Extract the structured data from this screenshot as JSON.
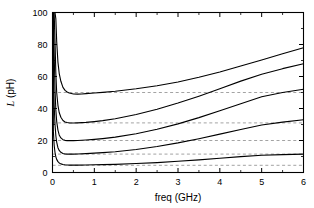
{
  "chart_data": {
    "type": "line",
    "title": "",
    "xlabel": "freq (GHz)",
    "ylabel": "L (pH)",
    "ylabel_symbol": "L",
    "ylabel_unit": "(pH)",
    "xlim": [
      0,
      6
    ],
    "ylim": [
      0,
      100
    ],
    "xticks": [
      0,
      1,
      2,
      3,
      4,
      5,
      6
    ],
    "xticklabels": [
      "0",
      "1",
      "2",
      "3",
      "4",
      "5",
      "6"
    ],
    "yticks": [
      0,
      20,
      40,
      60,
      80,
      100
    ],
    "yticklabels": [
      "0",
      "20",
      "40",
      "60",
      "80",
      "100"
    ],
    "x_minor_step": 0.5,
    "y_minor_step": 10,
    "grid": false,
    "legend": null,
    "line_color": "#000000",
    "asymptote_color": "#999999",
    "asymptote_style": "dashed",
    "asymptotes": [
      50,
      31,
      20,
      11.5,
      4.5
    ],
    "series": [
      {
        "name": "L1",
        "asymptote": 50,
        "end_value": 78,
        "x": [
          0.02,
          0.04,
          0.06,
          0.08,
          0.1,
          0.13,
          0.16,
          0.2,
          0.25,
          0.3,
          0.35,
          0.4,
          0.5,
          0.6,
          0.7,
          0.8,
          1.0,
          1.2,
          1.5,
          2.0,
          2.5,
          3.0,
          3.5,
          4.0,
          4.5,
          5.0,
          5.5,
          6.0
        ],
        "y": [
          100,
          100,
          100,
          96,
          82,
          69,
          62,
          57,
          53.2,
          51.3,
          50.3,
          49.7,
          49.1,
          49.0,
          49.1,
          49.3,
          49.7,
          50.1,
          50.8,
          52.3,
          54.2,
          56.6,
          59.5,
          62.8,
          66.6,
          70.3,
          74.2,
          78.0
        ]
      },
      {
        "name": "L2",
        "asymptote": 31,
        "end_value": 68,
        "x": [
          0.02,
          0.04,
          0.06,
          0.08,
          0.1,
          0.13,
          0.16,
          0.2,
          0.25,
          0.3,
          0.35,
          0.4,
          0.5,
          0.6,
          0.8,
          1.0,
          1.2,
          1.5,
          2.0,
          2.5,
          3.0,
          3.5,
          4.0,
          4.5,
          5.0,
          5.5,
          6.0
        ],
        "y": [
          100,
          100,
          82,
          62,
          50,
          42,
          37.5,
          34.5,
          32.5,
          31.6,
          31.2,
          31.0,
          30.9,
          31.0,
          31.3,
          31.8,
          32.4,
          33.6,
          36.2,
          39.5,
          43.4,
          47.7,
          52.3,
          57.1,
          61.4,
          64.9,
          68.0
        ]
      },
      {
        "name": "L3",
        "asymptote": 20,
        "end_value": 52,
        "x": [
          0.02,
          0.04,
          0.06,
          0.08,
          0.1,
          0.13,
          0.16,
          0.2,
          0.25,
          0.3,
          0.35,
          0.4,
          0.5,
          0.6,
          0.8,
          1.0,
          1.2,
          1.5,
          2.0,
          2.5,
          3.0,
          3.5,
          4.0,
          4.5,
          5.0,
          5.5,
          6.0
        ],
        "y": [
          100,
          74,
          52,
          39,
          32,
          26.5,
          23.5,
          21.6,
          20.5,
          20.1,
          19.9,
          19.9,
          19.9,
          20.0,
          20.3,
          20.7,
          21.2,
          22.1,
          24.2,
          27.0,
          30.4,
          34.3,
          38.6,
          43.0,
          47.3,
          50.0,
          52.0
        ]
      },
      {
        "name": "L4",
        "asymptote": 11.5,
        "end_value": 33,
        "x": [
          0.02,
          0.04,
          0.06,
          0.08,
          0.1,
          0.13,
          0.16,
          0.2,
          0.25,
          0.3,
          0.35,
          0.4,
          0.5,
          0.6,
          0.8,
          1.0,
          1.2,
          1.5,
          2.0,
          2.5,
          3.0,
          3.5,
          4.0,
          4.5,
          5.0,
          5.5,
          6.0
        ],
        "y": [
          66,
          42,
          30,
          23,
          19,
          15.5,
          13.8,
          12.6,
          11.9,
          11.6,
          11.5,
          11.5,
          11.5,
          11.6,
          11.8,
          12.1,
          12.4,
          13.0,
          14.4,
          16.2,
          18.5,
          21.1,
          24.0,
          26.9,
          29.7,
          31.5,
          33.0
        ]
      },
      {
        "name": "L5",
        "asymptote": 4.5,
        "end_value": 11.5,
        "x": [
          0.02,
          0.04,
          0.06,
          0.08,
          0.1,
          0.13,
          0.16,
          0.2,
          0.25,
          0.3,
          0.35,
          0.4,
          0.5,
          0.6,
          0.8,
          1.0,
          1.2,
          1.5,
          2.0,
          2.5,
          3.0,
          3.5,
          4.0,
          4.5,
          5.0,
          5.5,
          6.0
        ],
        "y": [
          26,
          17,
          12.5,
          9.8,
          8.2,
          6.8,
          6.0,
          5.4,
          5.0,
          4.8,
          4.7,
          4.6,
          4.6,
          4.6,
          4.7,
          4.8,
          4.9,
          5.1,
          5.6,
          6.2,
          7.0,
          7.9,
          8.9,
          9.9,
          10.8,
          11.2,
          11.5
        ]
      }
    ]
  }
}
